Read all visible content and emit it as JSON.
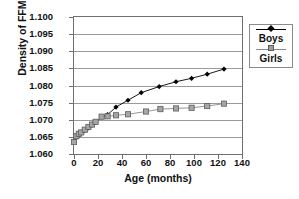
{
  "chart_data": {
    "type": "line",
    "title": "",
    "xlabel": "Age (months)",
    "ylabel": "Density of FFM (g/cm3)",
    "ylabel_base": "Density of FFM (g/cm",
    "ylabel_sup": "3",
    "ylabel_tail": ")",
    "xlim": [
      0,
      140
    ],
    "ylim": [
      1.06,
      1.1
    ],
    "xticks": [
      0,
      20,
      40,
      60,
      80,
      100,
      120,
      140
    ],
    "xticklabels": [
      "0",
      "20",
      "40",
      "60",
      "80",
      "100",
      "120",
      "140"
    ],
    "yticks": [
      1.06,
      1.065,
      1.07,
      1.075,
      1.08,
      1.085,
      1.09,
      1.095,
      1.1
    ],
    "yticklabels": [
      "1.060",
      "1.065",
      "1.070",
      "1.075",
      "1.080",
      "1.085",
      "1.090",
      "1.095",
      "1.100"
    ],
    "grid": "horizontal",
    "legend_position": "right-outside",
    "series": [
      {
        "name": "Boys",
        "marker": "diamond",
        "color": "#000000",
        "x": [
          0,
          2,
          4,
          6,
          9,
          12,
          15,
          18,
          23,
          28,
          35,
          45,
          56,
          71,
          85,
          98,
          111,
          125
        ],
        "y": [
          1.0638,
          1.0648,
          1.0655,
          1.0661,
          1.0668,
          1.0676,
          1.0684,
          1.0692,
          1.0708,
          1.0715,
          1.0737,
          1.0757,
          1.0779,
          1.0797,
          1.0811,
          1.0821,
          1.0833,
          1.0848
        ]
      },
      {
        "name": "Girls",
        "marker": "square",
        "color": "#9d9d9d",
        "x": [
          0,
          2,
          4,
          6,
          9,
          12,
          15,
          18,
          23,
          28,
          35,
          45,
          60,
          72,
          85,
          98,
          111,
          125
        ],
        "y": [
          1.0635,
          1.0652,
          1.0659,
          1.0663,
          1.0671,
          1.0679,
          1.0686,
          1.0694,
          1.0709,
          1.071,
          1.0713,
          1.0716,
          1.0724,
          1.0731,
          1.0733,
          1.0735,
          1.074,
          1.0747
        ]
      }
    ]
  },
  "legend": {
    "items": [
      {
        "label": "Boys"
      },
      {
        "label": "Girls"
      }
    ]
  }
}
